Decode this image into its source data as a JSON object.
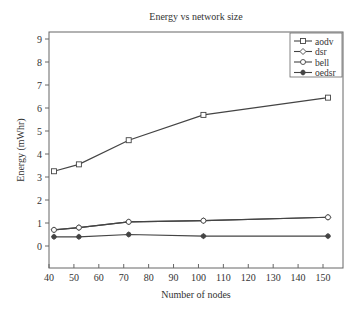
{
  "chart_data": {
    "type": "line",
    "title": "Energy vs network size",
    "xlabel": "Number of nodes",
    "ylabel": "Energy (mWhr)",
    "xlim": [
      40,
      158
    ],
    "ylim": [
      -1,
      9.3
    ],
    "xticks": [
      40,
      50,
      60,
      70,
      80,
      90,
      100,
      110,
      120,
      130,
      140,
      150
    ],
    "yticks": [
      0,
      1,
      2,
      3,
      4,
      5,
      6,
      7,
      8,
      9
    ],
    "grid": false,
    "legend_position": "upper right",
    "x": [
      42,
      52,
      72,
      102,
      152
    ],
    "series": [
      {
        "name": "aodv",
        "marker": "square",
        "values": [
          3.25,
          3.55,
          4.6,
          5.7,
          6.45
        ]
      },
      {
        "name": "dsr",
        "marker": "diamond",
        "values": [
          0.7,
          0.8,
          1.05,
          1.1,
          1.25
        ]
      },
      {
        "name": "bell",
        "marker": "circle",
        "values": [
          0.7,
          0.8,
          1.05,
          1.1,
          1.25
        ]
      },
      {
        "name": "oedsr",
        "marker": "star",
        "values": [
          0.4,
          0.4,
          0.5,
          0.43,
          0.43
        ]
      }
    ]
  },
  "colors": {
    "line": "#444444",
    "axis": "#555555",
    "text": "#333333"
  }
}
